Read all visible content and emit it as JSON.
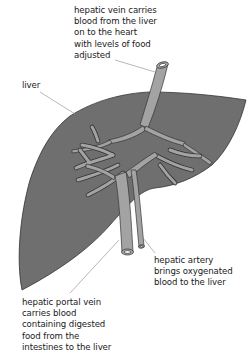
{
  "diagram": {
    "colors": {
      "liver_fill": "#6f6f6f",
      "vessel_fill": "#a3a3a3",
      "outline": "#333333",
      "leader_line": "#888888",
      "text": "#1a1a1a",
      "background": "#ffffff"
    },
    "labels": {
      "hepatic_vein": {
        "lines": [
          "hepatic vein carries",
          "blood from the liver",
          "on to the heart",
          "with levels of food",
          "adjusted"
        ]
      },
      "liver": {
        "lines": [
          "liver"
        ]
      },
      "hepatic_artery": {
        "lines": [
          "hepatic artery",
          "brings oxygenated",
          "blood to the liver"
        ]
      },
      "hepatic_portal_vein": {
        "lines": [
          "hepatic portal vein",
          "carries blood",
          "containing digested",
          "food from the",
          "intestines to the liver"
        ]
      }
    }
  }
}
